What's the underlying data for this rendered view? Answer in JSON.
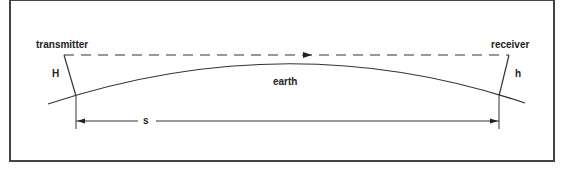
{
  "diagram": {
    "type": "line-of-sight radio horizon",
    "labels": {
      "transmitter": "transmitter",
      "receiver": "receiver",
      "transmitter_height": "H",
      "receiver_height": "h",
      "earth": "earth",
      "distance": "s"
    },
    "elements": [
      {
        "id": "direct-path",
        "style": "dashed",
        "from": "transmitter",
        "to": "receiver",
        "arrow": "toward receiver"
      },
      {
        "id": "earth-surface",
        "style": "curved arc"
      },
      {
        "id": "distance-dimension",
        "style": "double arrow",
        "label": "s"
      }
    ]
  }
}
